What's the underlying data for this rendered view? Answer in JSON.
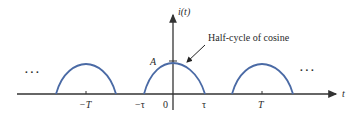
{
  "diagram": {
    "type": "periodic-signal",
    "y_axis_label": "i(t)",
    "x_axis_label": "t",
    "amplitude_label": "A",
    "annotation": "Half-cycle of cosine",
    "ellipsis_left": ". . .",
    "ellipsis_right": ". . .",
    "x_ticks": [
      {
        "label": "−T"
      },
      {
        "label": "−τ"
      },
      {
        "label": "0"
      },
      {
        "label": "τ"
      },
      {
        "label": "T"
      }
    ],
    "colors": {
      "pulse": "#4a6aa5",
      "axis": "#333333",
      "text": "#2a2a2a"
    }
  }
}
